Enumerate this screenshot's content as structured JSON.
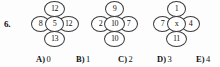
{
  "question": {
    "number": "6.",
    "clusters": [
      {
        "name": "cluster-1",
        "top": "12",
        "left": "8",
        "center": "5",
        "right": "12",
        "bottom": "13"
      },
      {
        "name": "cluster-2",
        "top": "9",
        "left": "2",
        "center": "10",
        "right": "7",
        "bottom": "10"
      },
      {
        "name": "cluster-3",
        "top": "1",
        "left": "7",
        "center": "x",
        "right": "4",
        "bottom": "11"
      }
    ],
    "answers": [
      {
        "label": "A)",
        "value": "0"
      },
      {
        "label": "B)",
        "value": "1"
      },
      {
        "label": "C)",
        "value": "2"
      },
      {
        "label": "D)",
        "value": "3"
      },
      {
        "label": "E)",
        "value": "4"
      }
    ]
  }
}
